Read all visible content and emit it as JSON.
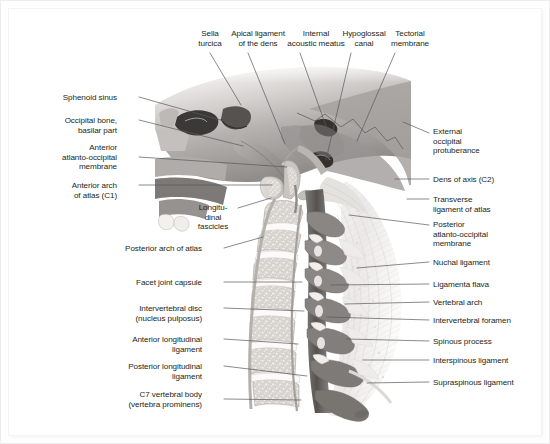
{
  "figure": {
    "view": "Midsagittal section, left lateral view",
    "style": "grayscale anatomical illustration"
  },
  "colors": {
    "page_background": "#ffffff",
    "outer_background": "#f2f2f3",
    "label_text": "#231f20",
    "leader_line": "#58595b",
    "bone_light": "#d8d5d2",
    "bone_mid": "#a9a5a2",
    "bone_dark": "#6e6b69",
    "cancellous": "#cfccc8",
    "ligament_pale": "#efeeec",
    "soft_tissue": "#8d8a88",
    "cord_dark": "#4f4d4c",
    "disc_white": "#fbfbfa"
  },
  "labels": {
    "top": [
      {
        "id": "sella-turcica",
        "text": "Sella\nturcica",
        "align": "center",
        "x": 201,
        "y": 20,
        "leader": [
          [
            201,
            44
          ],
          [
            232,
            96
          ]
        ]
      },
      {
        "id": "apical-ligament-of-the-dens",
        "text": "Apical ligament\nof the dens",
        "align": "center",
        "x": 249,
        "y": 20,
        "leader": [
          [
            239,
            44
          ],
          [
            276,
            135
          ]
        ]
      },
      {
        "id": "internal-acoustic-meatus",
        "text": "Internal\nacoustic meatus",
        "align": "center",
        "x": 307,
        "y": 20,
        "leader": [
          [
            291,
            44
          ],
          [
            318,
            120
          ]
        ]
      },
      {
        "id": "hypoglossal-canal",
        "text": "Hypoglossal\ncanal",
        "align": "center",
        "x": 355,
        "y": 20,
        "leader": [
          [
            342,
            44
          ],
          [
            317,
            151
          ]
        ]
      },
      {
        "id": "tectorial-membrane",
        "text": "Tectorial\nmembrane",
        "align": "center",
        "x": 401,
        "y": 20,
        "leader": [
          [
            386,
            44
          ],
          [
            348,
            132
          ]
        ]
      }
    ],
    "left": [
      {
        "id": "sphenoid-sinus",
        "text": "Sphenoid sinus",
        "align": "right",
        "x": 126,
        "y": 84,
        "leader": [
          [
            130,
            88
          ],
          [
            222,
            114
          ]
        ]
      },
      {
        "id": "occipital-bone-basilar-part",
        "text": "Occipital bone,\nbasilar part",
        "align": "right",
        "x": 126,
        "y": 107,
        "leader": [
          [
            130,
            111
          ],
          [
            234,
            137
          ]
        ]
      },
      {
        "id": "anterior-atlanto-occipital-membrane",
        "text": "Anterior\natlanto-occipital\nmembrane",
        "align": "right",
        "x": 126,
        "y": 134,
        "leader": [
          [
            130,
            148
          ],
          [
            278,
            158
          ]
        ]
      },
      {
        "id": "anterior-arch-of-atlas-c1",
        "text": "Anterior arch\nof atlas (C1)",
        "align": "right",
        "x": 126,
        "y": 172,
        "leader": [
          [
            130,
            176
          ],
          [
            263,
            176
          ]
        ]
      },
      {
        "id": "longitudinal-fascicles",
        "text": "Longitu-\ndinal\nfascicles",
        "align": "center",
        "x": 204,
        "y": 194,
        "leader": [
          [
            229,
            199
          ],
          [
            262,
            189
          ]
        ]
      },
      {
        "id": "posterior-arch-of-atlas",
        "text": "Posterior arch of atlas",
        "align": "right",
        "x": 211,
        "y": 235,
        "leader": [
          [
            215,
            239
          ],
          [
            254,
            228
          ]
        ]
      },
      {
        "id": "facet-joint-capsule",
        "text": "Facet joint capsule",
        "align": "right",
        "x": 211,
        "y": 269,
        "leader": [
          [
            215,
            273
          ],
          [
            293,
            273
          ]
        ]
      },
      {
        "id": "intervertebral-disc-nucleus-pulposus",
        "text": "Intervertebral disc\n(nucleus pulposus)",
        "align": "right",
        "x": 211,
        "y": 295,
        "leader": [
          [
            215,
            299
          ],
          [
            295,
            302
          ]
        ]
      },
      {
        "id": "anterior-longitudinal-ligament",
        "text": "Anterior longitudinal\nligament",
        "align": "right",
        "x": 211,
        "y": 326,
        "leader": [
          [
            215,
            330
          ],
          [
            289,
            335
          ]
        ]
      },
      {
        "id": "posterior-longitudinal-ligament",
        "text": "Posterior longitudinal\nligament",
        "align": "right",
        "x": 211,
        "y": 353,
        "leader": [
          [
            215,
            357
          ],
          [
            298,
            367
          ]
        ]
      },
      {
        "id": "c7-vertebral-body-vertebra-prominens",
        "text": "C7 vertebral body\n(vertebra prominens)",
        "align": "right",
        "x": 211,
        "y": 381,
        "leader": [
          [
            215,
            390
          ],
          [
            292,
            391
          ]
        ]
      }
    ],
    "right": [
      {
        "id": "external-occipital-protuberance",
        "text": "External\noccipital\nprotuberance",
        "align": "left",
        "x": 424,
        "y": 118,
        "leader": [
          [
            420,
            124
          ],
          [
            394,
            113
          ]
        ]
      },
      {
        "id": "dens-of-axis-c2",
        "text": "Dens of axis (C2)",
        "align": "left",
        "x": 424,
        "y": 166,
        "leader": [
          [
            420,
            170
          ],
          [
            386,
            170
          ]
        ]
      },
      {
        "id": "transverse-ligament-of-atlas",
        "text": "Transverse\nligament of atlas",
        "align": "left",
        "x": 424,
        "y": 186,
        "leader": [
          [
            420,
            190
          ],
          [
            398,
            190
          ]
        ]
      },
      {
        "id": "posterior-atlanto-occipital-membrane",
        "text": "Posterior\natlanto-occipital\nmembrane",
        "align": "left",
        "x": 424,
        "y": 211,
        "leader": [
          [
            420,
            216
          ],
          [
            340,
            206
          ]
        ]
      },
      {
        "id": "nuchal-ligament",
        "text": "Nuchal ligament",
        "align": "left",
        "x": 424,
        "y": 249,
        "leader": [
          [
            420,
            253
          ],
          [
            348,
            259
          ]
        ]
      },
      {
        "id": "ligamenta-flava",
        "text": "Ligamenta flava",
        "align": "left",
        "x": 424,
        "y": 271,
        "leader": [
          [
            420,
            275
          ],
          [
            322,
            276
          ]
        ]
      },
      {
        "id": "vertebral-arch",
        "text": "Vertebral arch",
        "align": "left",
        "x": 424,
        "y": 289,
        "leader": [
          [
            420,
            293
          ],
          [
            336,
            295
          ]
        ]
      },
      {
        "id": "intervertebral-foramen",
        "text": "Intervertebral foramen",
        "align": "left",
        "x": 424,
        "y": 307,
        "leader": [
          [
            420,
            311
          ],
          [
            318,
            308
          ]
        ]
      },
      {
        "id": "spinous-process",
        "text": "Spinous process",
        "align": "left",
        "x": 424,
        "y": 328,
        "leader": [
          [
            420,
            332
          ],
          [
            338,
            330
          ]
        ]
      },
      {
        "id": "interspinous-ligament",
        "text": "Interspinous ligament",
        "align": "left",
        "x": 424,
        "y": 347,
        "leader": [
          [
            420,
            351
          ],
          [
            354,
            351
          ]
        ]
      },
      {
        "id": "supraspinous-ligament",
        "text": "Supraspinous ligament",
        "align": "left",
        "x": 424,
        "y": 369,
        "leader": [
          [
            420,
            373
          ],
          [
            358,
            374
          ]
        ]
      }
    ]
  }
}
